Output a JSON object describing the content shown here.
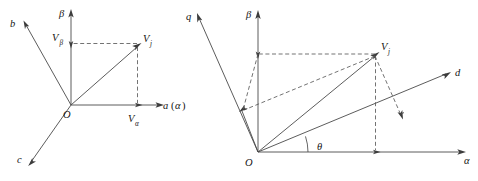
{
  "figure": {
    "background_color": "#ffffff",
    "line_color": "#4a4a4a",
    "text_color": "#141414"
  },
  "left_diagram": {
    "name": "three-phase-to-alpha-beta",
    "origin_label": "O",
    "axes": [
      {
        "key": "b_axis",
        "label": "b"
      },
      {
        "key": "c_axis",
        "label": "c"
      },
      {
        "key": "beta_axis",
        "label": "β"
      },
      {
        "key": "a_axis",
        "label": "a"
      },
      {
        "key": "a_axis_paren_open",
        "label": "("
      },
      {
        "key": "a_axis_alpha",
        "label": "α"
      },
      {
        "key": "a_axis_paren_close",
        "label": ")"
      }
    ],
    "vector": {
      "label_main": "V",
      "label_sub": "j"
    },
    "projections": [
      {
        "key": "v_beta",
        "label_main": "V",
        "label_sub": "β"
      },
      {
        "key": "v_alpha",
        "label_main": "V",
        "label_sub": "α"
      }
    ]
  },
  "right_diagram": {
    "name": "alpha-beta-to-dq",
    "origin_label": "O",
    "axes": [
      {
        "key": "q_axis",
        "label": "q"
      },
      {
        "key": "beta_axis",
        "label": "β"
      },
      {
        "key": "d_axis",
        "label": "d"
      },
      {
        "key": "alpha_axis",
        "label": "α"
      }
    ],
    "vector": {
      "label_main": "V",
      "label_sub": "j"
    },
    "angle": {
      "key": "theta_angle",
      "label": "θ"
    }
  }
}
